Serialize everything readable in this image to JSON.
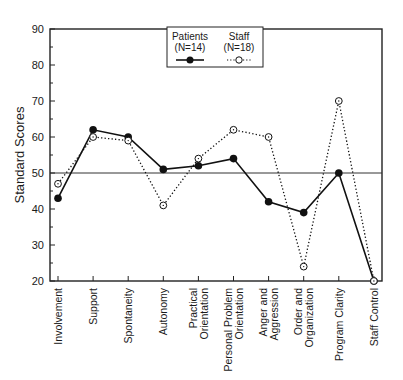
{
  "chart_data": {
    "type": "line",
    "title": "",
    "xlabel": "",
    "ylabel": "Standard Scores",
    "ylim": [
      20,
      90
    ],
    "yticks": [
      20,
      30,
      40,
      50,
      60,
      70,
      80,
      90
    ],
    "reference_line": 50,
    "grid": false,
    "legend_position": "top-center-inside",
    "categories": [
      "Involvement",
      "Support",
      "Spontaneity",
      "Autonomy",
      "Practical Orientation",
      "Personal Problem Orientation",
      "Anger and Aggression",
      "Order and Organization",
      "Program Clarity",
      "Staff Control"
    ],
    "category_lines": [
      [
        "Involvement"
      ],
      [
        "Support"
      ],
      [
        "Spontaneity"
      ],
      [
        "Autonomy"
      ],
      [
        "Practical",
        "Orientation"
      ],
      [
        "Personal Problem",
        "Orientation"
      ],
      [
        "Anger and",
        "Aggression"
      ],
      [
        "Order and",
        "Organization"
      ],
      [
        "Program Clarity"
      ],
      [
        "Staff Control"
      ]
    ],
    "series": [
      {
        "name": "Patients",
        "n_label": "(N=14)",
        "style": "solid-filled-circle",
        "values": [
          43,
          62,
          60,
          51,
          52,
          54,
          42,
          39,
          50,
          20
        ]
      },
      {
        "name": "Staff",
        "n_label": "(N=18)",
        "style": "dotted-open-circle",
        "values": [
          47,
          60,
          59,
          41,
          54,
          62,
          60,
          24,
          70,
          20
        ]
      }
    ]
  },
  "legend": {
    "patients_label": "Patients",
    "patients_n": "(N=14)",
    "staff_label": "Staff",
    "staff_n": "(N=18)"
  },
  "axis": {
    "ylabel": "Standard Scores"
  }
}
